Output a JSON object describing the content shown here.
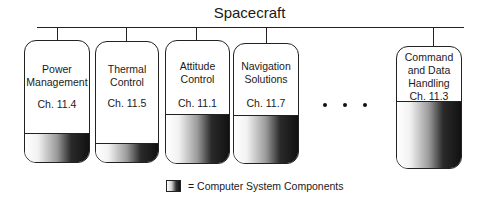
{
  "diagram": {
    "root": {
      "label": "Spacecraft"
    },
    "subsystems": [
      {
        "name": "Power\nManagement",
        "line1": "Power",
        "line2": "Management",
        "chapter": "Ch. 11.4"
      },
      {
        "name": "Thermal\nControl",
        "line1": "Thermal",
        "line2": "Control",
        "chapter": "Ch. 11.5"
      },
      {
        "name": "Attitude\nControl",
        "line1": "Attitude",
        "line2": "Control",
        "chapter": "Ch. 11.1"
      },
      {
        "name": "Navigation\nSolutions",
        "line1": "Navigation",
        "line2": "Solutions",
        "chapter": "Ch. 11.7"
      },
      {
        "name": "Command and Data Handling",
        "line1": "Command",
        "line2": "and Data",
        "line3": "Handling",
        "chapter": "Ch. 11.3"
      }
    ],
    "ellipsis": "• • •",
    "legend": {
      "text": "= Computer System Components",
      "icon": "gradient-swatch"
    }
  }
}
